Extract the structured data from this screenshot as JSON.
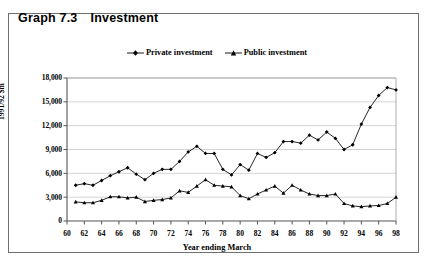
{
  "figure": {
    "number": "Graph 7.3",
    "title": "Investment"
  },
  "legend": {
    "position": "top-center",
    "entries": [
      {
        "label": "Private investment",
        "marker": "diamond",
        "color": "#000000"
      },
      {
        "label": "Public investment",
        "marker": "triangle",
        "color": "#000000"
      }
    ]
  },
  "chart_data": {
    "type": "line",
    "title": "Investment",
    "xlabel": "Year ending March",
    "ylabel": "1991/92 $m",
    "xlim": [
      60,
      98
    ],
    "ylim": [
      0,
      18000
    ],
    "yticks": [
      0,
      3000,
      6000,
      9000,
      12000,
      15000,
      18000
    ],
    "ytick_labels": [
      "0",
      "3,000",
      "6,000",
      "9,000",
      "12,000",
      "15,000",
      "18,000"
    ],
    "xticks": [
      60,
      62,
      64,
      66,
      68,
      70,
      72,
      74,
      76,
      78,
      80,
      82,
      84,
      86,
      88,
      90,
      92,
      94,
      96,
      98
    ],
    "xtick_labels": [
      "60",
      "62",
      "64",
      "66",
      "68",
      "70",
      "72",
      "74",
      "76",
      "78",
      "80",
      "82",
      "84",
      "86",
      "88",
      "90",
      "92",
      "94",
      "96",
      "98"
    ],
    "grid": "horizontal",
    "x": [
      61,
      62,
      63,
      64,
      65,
      66,
      67,
      68,
      69,
      70,
      71,
      72,
      73,
      74,
      75,
      76,
      77,
      78,
      79,
      80,
      81,
      82,
      83,
      84,
      85,
      86,
      87,
      88,
      89,
      90,
      91,
      92,
      93,
      94,
      95,
      96,
      97,
      98
    ],
    "series": [
      {
        "name": "Private investment",
        "marker": "diamond",
        "color": "#000000",
        "values": [
          4500,
          4700,
          4500,
          5100,
          5700,
          6200,
          6700,
          5900,
          5200,
          6000,
          6500,
          6500,
          7500,
          8700,
          9400,
          8500,
          8500,
          6500,
          5800,
          7100,
          6400,
          8500,
          8000,
          8600,
          10000,
          10000,
          9800,
          10800,
          10200,
          11200,
          10400,
          9000,
          9600,
          12200,
          14300,
          15800,
          16800,
          16500
        ]
      },
      {
        "name": "Public investment",
        "marker": "triangle",
        "color": "#000000",
        "values": [
          2400,
          2300,
          2300,
          2600,
          3050,
          3050,
          2900,
          3000,
          2450,
          2600,
          2700,
          2900,
          3800,
          3600,
          4400,
          5200,
          4500,
          4400,
          4300,
          3200,
          2800,
          3400,
          3900,
          4400,
          3500,
          4500,
          3900,
          3400,
          3200,
          3200,
          3400,
          2200,
          1900,
          1800,
          1900,
          1950,
          2200,
          3000
        ]
      }
    ]
  }
}
